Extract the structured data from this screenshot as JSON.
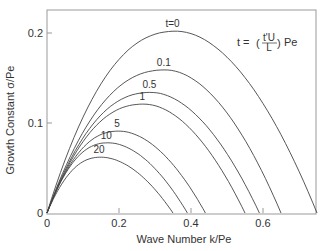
{
  "chart_data": {
    "type": "line",
    "title": "",
    "xlabel": "Wave Number k/Pe",
    "ylabel": "Growth Constant σ/Pe",
    "xlim": [
      0,
      0.75
    ],
    "ylim": [
      0,
      0.225
    ],
    "xticks": [
      "0",
      "0.2",
      "0.4",
      "0.6"
    ],
    "yticks": [
      "0",
      "0.1",
      "0.2"
    ],
    "grid": false,
    "legend": "inline curve labels",
    "annotation": "t = (t'U/L) Pe",
    "series": [
      {
        "name": "t=0",
        "label": "t=0",
        "peak_k": 0.36,
        "peak_sigma": 0.202,
        "zero_k": 0.75
      },
      {
        "name": "0.1",
        "label": "0.1",
        "peak_k": 0.33,
        "peak_sigma": 0.159,
        "zero_k": 0.65
      },
      {
        "name": "0.5",
        "label": "0.5",
        "peak_k": 0.29,
        "peak_sigma": 0.134,
        "zero_k": 0.59
      },
      {
        "name": "1",
        "label": "1",
        "peak_k": 0.27,
        "peak_sigma": 0.121,
        "zero_k": 0.55
      },
      {
        "name": "5",
        "label": "5",
        "peak_k": 0.2,
        "peak_sigma": 0.091,
        "zero_k": 0.44
      },
      {
        "name": "10",
        "label": "10",
        "peak_k": 0.17,
        "peak_sigma": 0.078,
        "zero_k": 0.39
      },
      {
        "name": "20",
        "label": "20",
        "peak_k": 0.15,
        "peak_sigma": 0.062,
        "zero_k": 0.35
      }
    ]
  },
  "labels": {
    "xlabel": "Wave Number  k/Pe",
    "ylabel": "Growth Constant  σ/Pe",
    "annot_t": "t =",
    "annot_num": "t'U",
    "annot_den": "L",
    "annot_pe": "Pe"
  }
}
